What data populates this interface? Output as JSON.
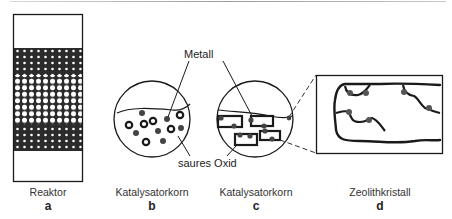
{
  "panels": [
    {
      "id": "a",
      "caption": "Reaktor",
      "letter": "a"
    },
    {
      "id": "b",
      "caption": "Katalysatorkorn",
      "letter": "b"
    },
    {
      "id": "c",
      "caption": "Katalysatorkorn",
      "letter": "c"
    },
    {
      "id": "d",
      "caption": "Zeolithkristall",
      "letter": "d"
    }
  ],
  "callouts": {
    "metal": "Metall",
    "acid_oxide": "saures Oxid"
  },
  "colors": {
    "line": "#1a1a1a",
    "fill_dark": "#2b2b2b",
    "dot": "#444444"
  }
}
